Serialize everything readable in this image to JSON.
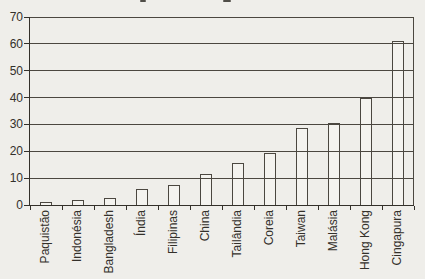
{
  "meta": {
    "background_color": "#efeeea",
    "bar_fill_color": "#f4f3ef",
    "grid_line_color": "#4b4740",
    "axis_line_color": "#33302a",
    "text_color": "#33302a"
  },
  "chart_data": {
    "type": "bar",
    "title": "",
    "categories": [
      "Paquistão",
      "Indonésia",
      "Bangladesh",
      "Índia",
      "Filipinas",
      "China",
      "Tailândia",
      "Coreia",
      "Taiwan",
      "Malásia",
      "Hong Kong",
      "Cingapura"
    ],
    "values": [
      1,
      2,
      2.5,
      6,
      7.5,
      11.5,
      15.5,
      19.5,
      28.5,
      30.5,
      40,
      61
    ],
    "xlabel": "",
    "ylabel": "",
    "ylim": [
      0,
      70
    ],
    "yticks": [
      0,
      10,
      20,
      30,
      40,
      50,
      60,
      70
    ],
    "grid": true,
    "legend": "none",
    "bar_style": "dark outline, unfilled; gridlines show through bars",
    "x_label_rotation": -90
  }
}
